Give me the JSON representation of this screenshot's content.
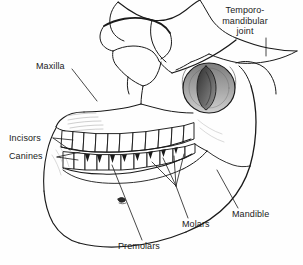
{
  "figure": {
    "background_color": "#fefefe",
    "line_color": "#1a1a1a",
    "label_color": "#1a1a1a",
    "shade_color": "#8a8a8a"
  },
  "labels": [
    {
      "id": "temporomandibular-joint",
      "text": "Temporo-\nmandibular\njoint",
      "lines": [
        "Temporo-",
        "mandibular",
        "joint"
      ],
      "x": 228,
      "y": 6,
      "align": "center"
    },
    {
      "id": "maxilla",
      "text": "Maxilla",
      "lines": [
        "Maxilla"
      ],
      "x": 36,
      "y": 62,
      "align": "left"
    },
    {
      "id": "incisors",
      "text": "Incisors",
      "lines": [
        "Incisors"
      ],
      "x": 9,
      "y": 134,
      "align": "left"
    },
    {
      "id": "canines",
      "text": "Canines",
      "lines": [
        "Canines"
      ],
      "x": 9,
      "y": 152,
      "align": "left"
    },
    {
      "id": "premolars",
      "text": "Premolars",
      "lines": [
        "Premolars"
      ],
      "x": 118,
      "y": 242,
      "align": "left"
    },
    {
      "id": "molars",
      "text": "Molars",
      "lines": [
        "Molars"
      ],
      "x": 182,
      "y": 222,
      "align": "left"
    },
    {
      "id": "mandible",
      "text": "Mandible",
      "lines": [
        "Mandible"
      ],
      "x": 232,
      "y": 212,
      "align": "left"
    }
  ],
  "structures": [
    {
      "id": "cranium-outline",
      "name": "cranium"
    },
    {
      "id": "orbit",
      "name": "eye-socket"
    },
    {
      "id": "zygomatic-arch",
      "name": "cheekbone-arch"
    },
    {
      "id": "external-auditory-meatus",
      "name": "ear-canal"
    },
    {
      "id": "maxilla-bone",
      "name": "upper-jaw"
    },
    {
      "id": "mandible-bone",
      "name": "lower-jaw"
    },
    {
      "id": "mental-foramen",
      "name": "mental-foramen"
    },
    {
      "id": "upper-teeth-row",
      "name": "upper-dental-arch"
    },
    {
      "id": "lower-teeth-row",
      "name": "lower-dental-arch"
    }
  ]
}
